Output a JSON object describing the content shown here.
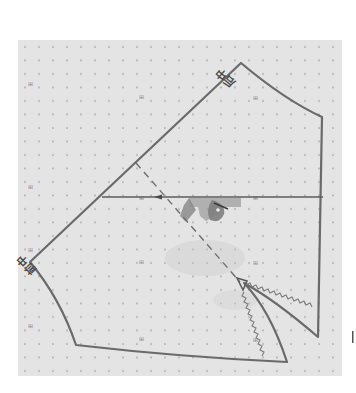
{
  "diagram": {
    "type": "sewing-pattern",
    "labels": {
      "back_center": "后中",
      "front_center": "前中"
    },
    "colors": {
      "background": "#ffffff",
      "grid_paper": "#e4e4e4",
      "grid_dot": "#a8a8a8",
      "outline": "#6a6a6a",
      "shadow_fill": "#8c8c8c"
    },
    "grid": {
      "x": 18,
      "y": 40,
      "width": 324,
      "height": 336,
      "dot_spacing": 14
    },
    "vertices": {
      "top_apex": [
        241,
        63
      ],
      "right_upper": [
        322,
        117
      ],
      "right_lower": [
        318,
        337
      ],
      "left_point": [
        30,
        262
      ],
      "left_bottom": [
        76,
        345
      ],
      "bottom_right": [
        287,
        362
      ],
      "dart_tip": [
        240,
        282
      ]
    }
  }
}
